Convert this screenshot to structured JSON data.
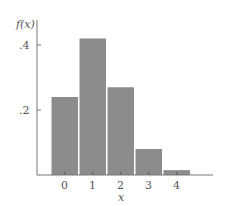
{
  "chart_data": {
    "type": "bar",
    "title": "",
    "xlabel": "x",
    "ylabel": "f(x)",
    "categories": [
      "0",
      "1",
      "2",
      "3",
      "4"
    ],
    "values": [
      0.24,
      0.42,
      0.27,
      0.08,
      0.015
    ],
    "yticks": [
      ".2",
      ".4"
    ],
    "ytick_values": [
      0.2,
      0.4
    ],
    "ylim": [
      0,
      0.45
    ],
    "grid": false,
    "legend": null,
    "bar_color": "#8c8c8c",
    "axis_color": "#777777"
  }
}
